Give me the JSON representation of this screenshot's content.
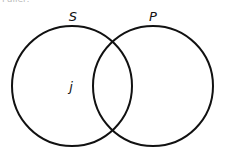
{
  "diagram": {
    "type": "venn",
    "stroke_color": "#111111",
    "sets": [
      {
        "label": "S",
        "cx": 72,
        "cy": 86,
        "r": 60,
        "label_x": 73,
        "label_y": 21
      },
      {
        "label": "P",
        "cx": 153,
        "cy": 86,
        "r": 60,
        "label_x": 153,
        "label_y": 21
      }
    ],
    "elements": [
      {
        "label": "j",
        "x": 71,
        "y": 91,
        "region": "S only"
      }
    ],
    "cutoff_text": "Fuller:"
  }
}
